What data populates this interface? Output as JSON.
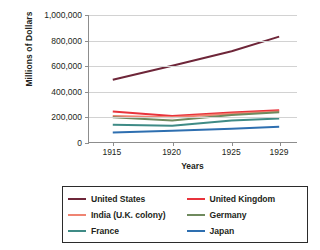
{
  "chart_data": {
    "type": "line",
    "title": "",
    "xlabel": "Years",
    "ylabel": "Millions of Dollars",
    "x": [
      1915,
      1920,
      1925,
      1929
    ],
    "xlim": [
      1913,
      1930.5
    ],
    "ylim": [
      0,
      1000000
    ],
    "grid": true,
    "legend_position": "below",
    "xtick_labels": [
      "1915",
      "1920",
      "1925",
      "1929"
    ],
    "ytick_labels": [
      "0",
      "200,000",
      "400,000",
      "600,000",
      "800,000",
      "1,000,000"
    ],
    "ytick_values": [
      0,
      200000,
      400000,
      600000,
      800000,
      1000000
    ],
    "series": [
      {
        "name": "United States",
        "color": "#6e2639",
        "values": [
          490000,
          600000,
          715000,
          830000
        ]
      },
      {
        "name": "United Kingdom",
        "color": "#e8333c",
        "values": [
          240000,
          205000,
          232000,
          250000
        ]
      },
      {
        "name": "India (U.K. colony)",
        "color": "#ef8472",
        "values": [
          205000,
          195000,
          222000,
          240000
        ]
      },
      {
        "name": "Germany",
        "color": "#6f8a5e",
        "values": [
          195000,
          170000,
          212000,
          235000
        ]
      },
      {
        "name": "France",
        "color": "#3f8b86",
        "values": [
          135000,
          128000,
          170000,
          185000
        ]
      },
      {
        "name": "Japan",
        "color": "#2e6fb0",
        "values": [
          75000,
          88000,
          105000,
          120000
        ]
      }
    ]
  },
  "legend": {
    "entries": [
      {
        "label": "United States",
        "color": "#6e2639"
      },
      {
        "label": "United Kingdom",
        "color": "#e8333c"
      },
      {
        "label": "India (U.K. colony)",
        "color": "#ef8472"
      },
      {
        "label": "Germany",
        "color": "#6f8a5e"
      },
      {
        "label": "France",
        "color": "#3f8b86"
      },
      {
        "label": "Japan",
        "color": "#2e6fb0"
      }
    ]
  }
}
